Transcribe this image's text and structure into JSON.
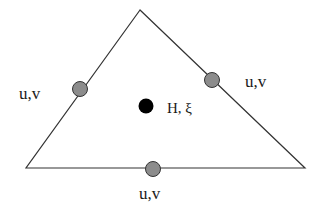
{
  "diagram": {
    "type": "triangular finite element",
    "colors": {
      "stroke": "#333333",
      "node_fill": "#8c8c8c",
      "center_fill": "#000000"
    },
    "nodes": [
      {
        "id": "left-edge-node",
        "label": "u,v"
      },
      {
        "id": "right-edge-node",
        "label": "u,v"
      },
      {
        "id": "bottom-edge-node",
        "label": "u,v"
      }
    ],
    "center_node": {
      "label": "H, ξ"
    }
  }
}
